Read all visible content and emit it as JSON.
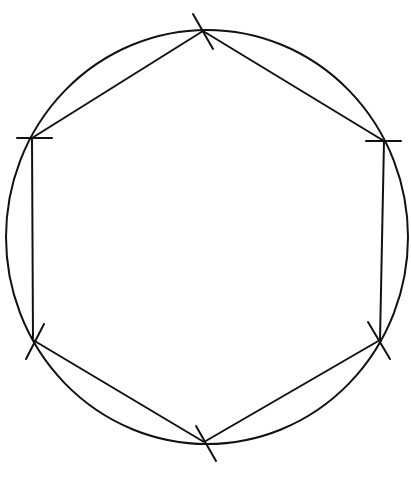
{
  "diagram": {
    "title": "",
    "stroke_color": "#111111",
    "background": "#ffffff",
    "circle": {
      "cx": 207,
      "cy": 237,
      "rx": 201,
      "ry": 207
    },
    "vertices": [
      {
        "name": "top",
        "x": 203,
        "y": 31,
        "tick": [
          193,
          14,
          213,
          49
        ]
      },
      {
        "name": "upper-right",
        "x": 384,
        "y": 141,
        "tick": [
          366,
          141,
          401,
          141
        ]
      },
      {
        "name": "lower-right",
        "x": 380,
        "y": 340,
        "tick": [
          368,
          322,
          390,
          359
        ]
      },
      {
        "name": "bottom",
        "x": 204,
        "y": 442,
        "tick": [
          196,
          426,
          216,
          461
        ]
      },
      {
        "name": "lower-left",
        "x": 33,
        "y": 340,
        "tick": [
          26,
          359,
          44,
          324
        ]
      },
      {
        "name": "upper-left",
        "x": 32,
        "y": 138,
        "tick": [
          17,
          138,
          52,
          138
        ]
      }
    ]
  }
}
